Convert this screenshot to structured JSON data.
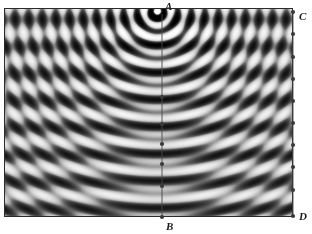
{
  "figure": {
    "kind": "wave-interference-caustic-diagram",
    "background_color": "#ffffff",
    "plot": {
      "x": 4,
      "y": 8,
      "width": 289,
      "height": 209,
      "border_color": "#2b2b2b",
      "colormap": "grayscale",
      "min_color": "#000000",
      "max_color": "#ffffff"
    }
  },
  "labels": {
    "a": "A",
    "b": "B",
    "c": "C",
    "d": "D"
  },
  "source": {
    "name": "point-source-A",
    "x": 162,
    "y": 14,
    "highlight_color": "#ffffff"
  },
  "secondary_focus": {
    "name": "caustic-focus",
    "x": 150,
    "y": 97
  },
  "ray_line_ab": {
    "color": "#4a4a4a",
    "from": {
      "x": 162,
      "y": 14
    },
    "to": {
      "x": 162,
      "y": 217
    },
    "marker_color": "#3a3a3a",
    "marker_radius": 2.1,
    "markers_y": [
      97,
      124,
      144,
      164,
      186,
      217
    ]
  },
  "edge_line_cd": {
    "color": "#4a4a4a",
    "from": {
      "x": 293,
      "y": 12
    },
    "to": {
      "x": 293,
      "y": 216
    },
    "marker_color": "#3a3a3a",
    "marker_radius": 2.1,
    "markers_y": [
      12,
      34,
      57,
      79,
      101,
      123,
      145,
      167,
      190,
      216
    ]
  },
  "chart_data": {
    "type": "heatmap",
    "title": "",
    "xlabel": "",
    "ylabel": "",
    "colormap": "gray",
    "x_range": [
      -1.45,
      1.45
    ],
    "y_range": [
      0.0,
      2.1
    ],
    "grid": false,
    "legend": "none",
    "nx": 289,
    "ny": 209,
    "model": {
      "source_x": 0.09,
      "source_y": 0.03,
      "k_radial": 46.0,
      "k_plane": 23.0,
      "amp_radial": 1.0,
      "amp_plane": 1.0,
      "decay": 0.55
    },
    "annotations": [
      {
        "label": "A",
        "x": 162,
        "y": 14,
        "role": "source"
      },
      {
        "label": "B",
        "x": 162,
        "y": 217,
        "role": "ray-endpoint"
      },
      {
        "label": "C",
        "x": 293,
        "y": 12,
        "role": "edge-top"
      },
      {
        "label": "D",
        "x": 293,
        "y": 216,
        "role": "edge-bottom"
      }
    ]
  }
}
